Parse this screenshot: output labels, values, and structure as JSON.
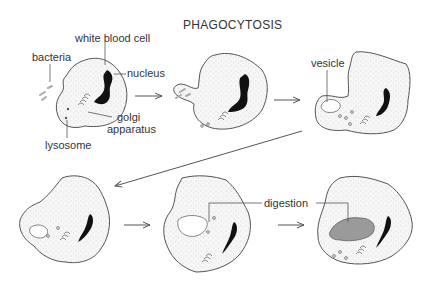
{
  "title": "PHAGOCYTOSIS",
  "labels": {
    "white_blood_cell": "white blood cell",
    "bacteria": "bacteria",
    "nucleus": "nucleus",
    "golgi_line1": "golgi",
    "golgi_line2": "apparatus",
    "lysosome": "lysosome",
    "vesicle": "vesicle",
    "digestion": "digestion"
  },
  "stages": [
    {
      "index": 1,
      "description": "white blood cell approaches bacteria"
    },
    {
      "index": 2,
      "description": "cell extends pseudopods around bacteria"
    },
    {
      "index": 3,
      "description": "bacteria enclosed in vesicle"
    },
    {
      "index": 4,
      "description": "vesicle moves inward with lysosomes"
    },
    {
      "index": 5,
      "description": "lysosomes fuse with vesicle"
    },
    {
      "index": 6,
      "description": "bacteria digested"
    }
  ],
  "colors": {
    "outline": "#555555",
    "nucleus": "#111111",
    "digestion_fill": "#9a9a9a",
    "stipple": "#b5b5b5"
  }
}
